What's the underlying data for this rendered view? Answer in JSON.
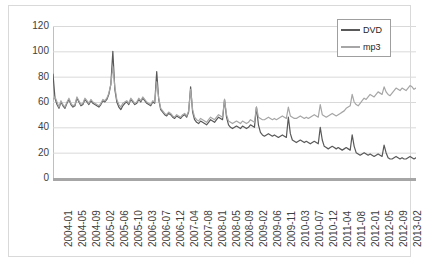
{
  "chart_data": {
    "type": "line",
    "title": "",
    "xlabel": "",
    "ylabel": "",
    "ylim": [
      0,
      120
    ],
    "ytick_values": [
      120,
      100,
      80,
      60,
      40,
      20,
      0
    ],
    "grid": true,
    "legend_position": "top-right",
    "tick_labels": [
      "2004-01",
      "2004-05",
      "2004-09",
      "2005-02",
      "2005-06",
      "2005-10",
      "2006-03",
      "2006-07",
      "2006-12",
      "2007-04",
      "2007-08",
      "2008-01",
      "2008-05",
      "2008-09",
      "2009-02",
      "2009-06",
      "2009-11",
      "2010-03",
      "2010-07",
      "2010-12",
      "2011-04",
      "2011-08",
      "2012-01",
      "2012-05",
      "2012-09",
      "2013-02"
    ],
    "series": [
      {
        "name": "DVD",
        "color": "#595959",
        "values": [
          82,
          63,
          58,
          55,
          60,
          57,
          55,
          59,
          62,
          58,
          56,
          57,
          63,
          60,
          57,
          58,
          62,
          60,
          58,
          61,
          59,
          58,
          57,
          56,
          58,
          61,
          60,
          62,
          66,
          74,
          100,
          70,
          60,
          56,
          54,
          57,
          59,
          60,
          58,
          62,
          60,
          58,
          59,
          62,
          60,
          63,
          61,
          59,
          58,
          57,
          60,
          59,
          84,
          62,
          54,
          52,
          50,
          49,
          51,
          50,
          48,
          47,
          49,
          48,
          47,
          49,
          50,
          48,
          52,
          72,
          52,
          46,
          44,
          43,
          45,
          44,
          43,
          42,
          44,
          46,
          45,
          44,
          46,
          48,
          47,
          46,
          62,
          48,
          42,
          40,
          39,
          40,
          41,
          40,
          39,
          41,
          40,
          39,
          40,
          42,
          41,
          40,
          56,
          42,
          36,
          34,
          33,
          34,
          35,
          34,
          33,
          34,
          33,
          32,
          33,
          34,
          33,
          32,
          48,
          35,
          30,
          29,
          28,
          29,
          30,
          29,
          28,
          29,
          28,
          27,
          28,
          29,
          28,
          27,
          40,
          30,
          25,
          24,
          23,
          24,
          25,
          24,
          23,
          24,
          23,
          22,
          23,
          24,
          23,
          22,
          34,
          25,
          20,
          19,
          18,
          19,
          20,
          19,
          18,
          19,
          18,
          17,
          18,
          19,
          18,
          17,
          26,
          20,
          16,
          15,
          15,
          16,
          17,
          16,
          15,
          16,
          15,
          15,
          16,
          17,
          16,
          15,
          16
        ]
      },
      {
        "name": "mp3",
        "color": "#a6a6a6",
        "values": [
          62,
          64,
          60,
          56,
          61,
          58,
          56,
          60,
          63,
          59,
          57,
          58,
          64,
          61,
          58,
          59,
          63,
          61,
          59,
          62,
          60,
          59,
          58,
          57,
          59,
          62,
          61,
          63,
          67,
          74,
          88,
          72,
          62,
          58,
          56,
          59,
          60,
          61,
          59,
          63,
          61,
          59,
          60,
          63,
          61,
          64,
          62,
          60,
          59,
          58,
          61,
          60,
          76,
          63,
          55,
          53,
          51,
          50,
          52,
          51,
          49,
          48,
          50,
          49,
          48,
          50,
          51,
          49,
          53,
          70,
          54,
          48,
          46,
          45,
          47,
          46,
          45,
          44,
          46,
          48,
          47,
          46,
          48,
          50,
          49,
          48,
          62,
          50,
          45,
          44,
          43,
          44,
          45,
          44,
          43,
          45,
          44,
          43,
          44,
          46,
          45,
          44,
          56,
          48,
          47,
          46,
          46,
          47,
          48,
          47,
          46,
          47,
          46,
          47,
          48,
          49,
          48,
          47,
          56,
          49,
          48,
          47,
          47,
          48,
          49,
          48,
          47,
          48,
          47,
          48,
          49,
          50,
          49,
          48,
          58,
          50,
          49,
          48,
          49,
          50,
          51,
          50,
          49,
          50,
          51,
          52,
          53,
          55,
          56,
          57,
          66,
          60,
          58,
          57,
          59,
          61,
          63,
          62,
          64,
          66,
          65,
          64,
          66,
          68,
          67,
          66,
          72,
          68,
          66,
          65,
          67,
          69,
          71,
          70,
          69,
          71,
          70,
          69,
          71,
          73,
          72,
          70,
          71
        ]
      }
    ]
  },
  "legend": {
    "entries": [
      {
        "label": "DVD",
        "color": "#595959"
      },
      {
        "label": "mp3",
        "color": "#a6a6a6"
      }
    ]
  },
  "colors": {
    "gridline": "#d9d9d9",
    "axis": "#a6a6a6",
    "tick_text": "#404040",
    "border": "#d9d9d9",
    "background": "#ffffff"
  }
}
